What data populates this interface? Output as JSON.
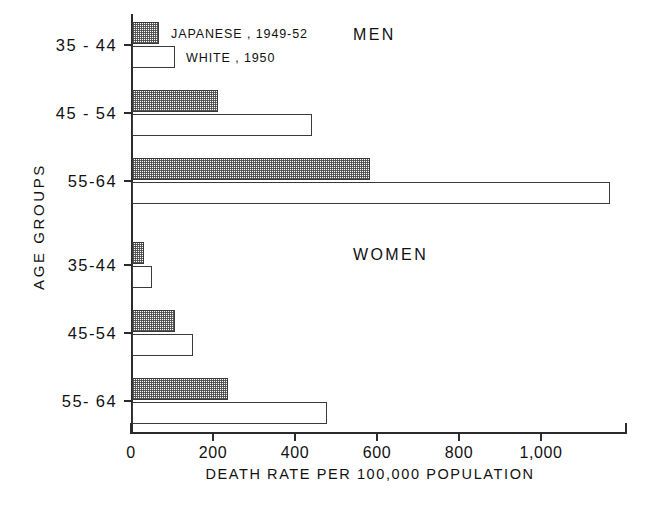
{
  "chart_data": {
    "type": "bar",
    "orientation": "horizontal",
    "title": "",
    "xlabel": "DEATH  RATE  PER  100,000  POPULATION",
    "ylabel": "AGE  GROUPS",
    "xlim": [
      0,
      1210
    ],
    "xticks": [
      0,
      200,
      400,
      600,
      800,
      1000
    ],
    "xticklabels": [
      "0",
      "200",
      "400",
      "600",
      "800",
      "1,000"
    ],
    "grid": false,
    "legend": {
      "position": "top-left-inside",
      "entries": [
        {
          "label": "JAPANESE , 1949-52",
          "style": "shaded"
        },
        {
          "label": "WHITE , 1950",
          "style": "white"
        }
      ]
    },
    "panels": [
      {
        "name": "MEN",
        "categories": [
          "35 - 44",
          "45 - 54",
          "55-64"
        ],
        "series": [
          {
            "name": "JAPANESE , 1949-52",
            "style": "shaded",
            "values": [
              65,
              210,
              580
            ]
          },
          {
            "name": "WHITE , 1950",
            "style": "white",
            "values": [
              105,
              440,
              1165
            ]
          }
        ]
      },
      {
        "name": "WOMEN",
        "categories": [
          "35-44",
          "45-54",
          "55- 64"
        ],
        "series": [
          {
            "name": "JAPANESE , 1949-52",
            "style": "shaded",
            "values": [
              30,
              105,
              233
            ]
          },
          {
            "name": "WHITE , 1950",
            "style": "white",
            "values": [
              50,
              148,
              475
            ]
          }
        ]
      }
    ]
  },
  "axis": {
    "xlabel": "DEATH  RATE  PER  100,000  POPULATION",
    "ylabel": "AGE  GROUPS",
    "ticklabels": [
      "0",
      "200",
      "400",
      "600",
      "800",
      "1,000"
    ]
  },
  "panels": {
    "men_title": "MEN",
    "women_title": "WOMEN"
  },
  "legend": {
    "japanese": "JAPANESE , 1949-52",
    "white": "WHITE , 1950"
  },
  "categories": {
    "men": [
      "35 - 44",
      "45 - 54",
      "55-64"
    ],
    "women": [
      "35-44",
      "45-54",
      "55- 64"
    ]
  },
  "colors": {
    "ink": "#2b2b2b",
    "bar_fill_white": "#ffffff",
    "bar_fill_shaded": "#c9c9c9",
    "background": "#ffffff"
  }
}
